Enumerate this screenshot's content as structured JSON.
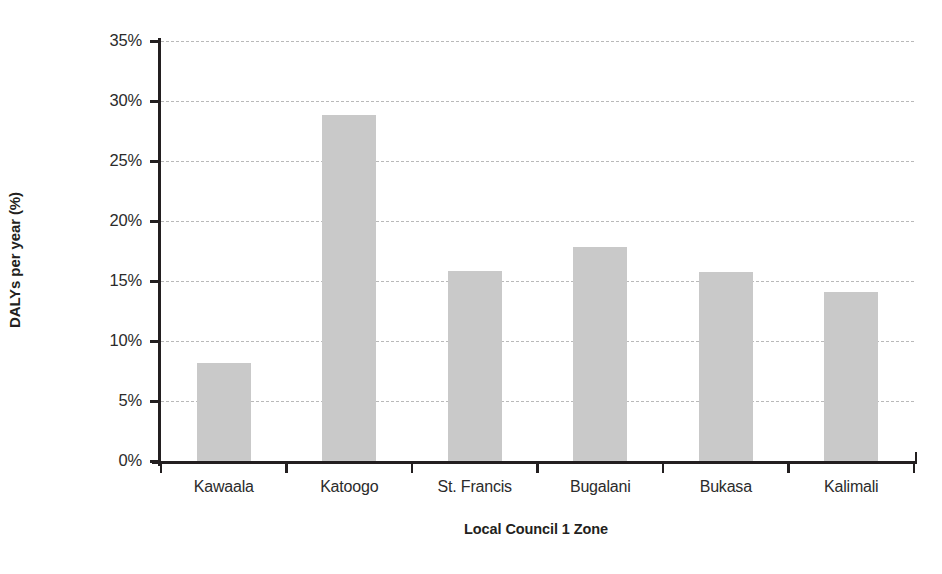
{
  "chart_data": {
    "type": "bar",
    "title": "",
    "xlabel": "Local Council 1 Zone",
    "ylabel": "DALYs per year (%)",
    "categories": [
      "Kawaala",
      "Katoogo",
      "St. Francis",
      "Bugalani",
      "Bukasa",
      "Kalimali"
    ],
    "values": [
      8.2,
      28.9,
      15.9,
      17.9,
      15.8,
      14.1
    ],
    "ylim": [
      0,
      35
    ],
    "ytick_values": [
      0,
      5,
      10,
      15,
      20,
      25,
      30,
      35
    ],
    "ytick_labels": [
      "0%",
      "5%",
      "10%",
      "15%",
      "20%",
      "25%",
      "30%",
      "35%"
    ],
    "grid": true,
    "grid_axis": "y",
    "grid_style": "dashed",
    "legend": false,
    "legend_position": "none",
    "bar_color": "#c9c9c9",
    "axis_color": "#231f20",
    "gridline_color": "#b9b9b9",
    "background_color": "#ffffff"
  }
}
